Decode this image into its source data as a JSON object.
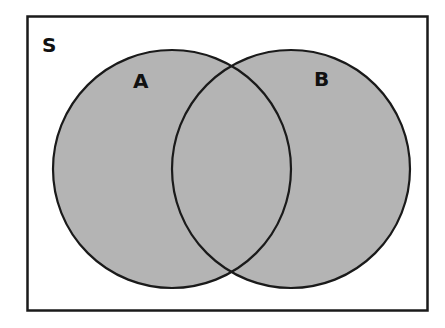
{
  "diagram": {
    "type": "venn",
    "universe_label": "S",
    "sets": [
      {
        "label": "A",
        "shaded": true
      },
      {
        "label": "B",
        "shaded": true
      }
    ],
    "intersection_shaded": true,
    "shaded_region": "A ∪ B",
    "colors": {
      "fill": "#b4b4b4",
      "stroke": "#1a1a1a",
      "background": "#ffffff"
    }
  }
}
